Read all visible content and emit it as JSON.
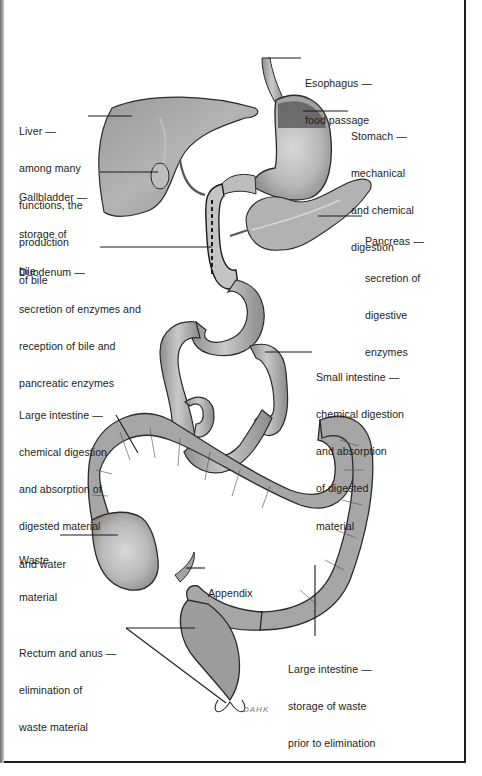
{
  "diagram": {
    "colors": {
      "organ_fill": "#a8a8a8",
      "organ_dark": "#7a7a7a",
      "organ_light": "#cfcfcf",
      "outline": "#2a2a2a",
      "leader_line": "#1a1a1a",
      "text": "#1d1d1d",
      "background": "#ffffff",
      "frame": "#1a1a1a"
    },
    "labels": {
      "esophagus": {
        "title": "Esophagus —",
        "lines": [
          "food passage"
        ]
      },
      "stomach": {
        "title": "Stomach —",
        "lines": [
          "mechanical",
          "and chemical",
          "digestion"
        ]
      },
      "liver": {
        "title": "Liver —",
        "lines": [
          "among many",
          "functions, the",
          "production",
          "of bile"
        ]
      },
      "gallbladder": {
        "title": "Gallbladder —",
        "lines": [
          "storage of",
          "bile"
        ]
      },
      "pancreas": {
        "title": "Pancreas —",
        "lines": [
          "secretion of",
          "digestive",
          "enzymes"
        ]
      },
      "duodenum": {
        "title": "Duodenum —",
        "lines": [
          "secretion of enzymes and",
          "reception of bile and",
          "pancreatic enzymes"
        ]
      },
      "small_intestine": {
        "title": "Small intestine —",
        "lines": [
          "chemical digestion",
          "and absorption",
          "of digested",
          "material"
        ]
      },
      "large_intestine_upper": {
        "title": "Large intestine —",
        "lines": [
          "chemical digestion",
          "and absorption of",
          "digested material",
          "and water"
        ]
      },
      "waste_material": {
        "title": "Waste",
        "lines": [
          "material"
        ]
      },
      "appendix": {
        "title": "Appendix",
        "lines": []
      },
      "rectum_anus": {
        "title": "Rectum and anus —",
        "lines": [
          "elimination of",
          "waste material"
        ]
      },
      "large_intestine_lower": {
        "title": "Large intestine —",
        "lines": [
          "storage of waste",
          "prior to elimination"
        ]
      }
    },
    "artist_signature": "DAHK"
  }
}
